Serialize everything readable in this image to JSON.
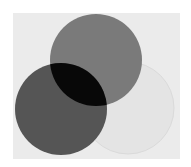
{
  "diagram": {
    "type": "venn",
    "page_background": "#ffffff",
    "panel": {
      "x": 13,
      "y": 13,
      "width": 167,
      "height": 146,
      "fill": "#ebebeb"
    },
    "circles": [
      {
        "name": "top-circle",
        "cx": 96,
        "cy": 60,
        "r": 46,
        "fill": "#7a7a7a"
      },
      {
        "name": "left-circle",
        "cx": 61,
        "cy": 109,
        "r": 46,
        "fill": "#555555"
      },
      {
        "name": "right-circle",
        "cx": 128,
        "cy": 108,
        "r": 46,
        "fill": "#e4e4e4",
        "stroke": "#dadada"
      }
    ],
    "overlaps": [
      {
        "name": "top-left-overlap",
        "fill": "#080808"
      },
      {
        "name": "top-right-overlap",
        "fill": "#7a7a7a"
      },
      {
        "name": "left-right-overlap",
        "fill": "#555555"
      }
    ]
  }
}
